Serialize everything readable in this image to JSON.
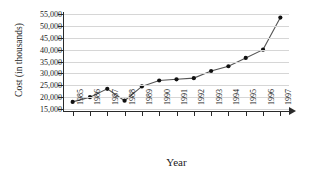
{
  "chart_data": {
    "type": "line",
    "title": "",
    "xlabel": "Year",
    "ylabel": "Cost (in thousands)",
    "x": [
      "1985",
      "1986",
      "1987",
      "1988",
      "1989",
      "1990",
      "1991",
      "1992",
      "1993",
      "1994",
      "1995",
      "1996",
      "1997"
    ],
    "categories": [
      "1985",
      "1986",
      "1987",
      "1988",
      "1989",
      "1990",
      "1991",
      "1992",
      "1993",
      "1994",
      "1995",
      "1996",
      "1997"
    ],
    "values": [
      18000,
      20000,
      23500,
      18500,
      24500,
      27000,
      27500,
      28000,
      31000,
      33000,
      36500,
      40000,
      53500
    ],
    "series": [
      {
        "name": "Cost",
        "values": [
          18000,
          20000,
          23500,
          18500,
          24500,
          27000,
          27500,
          28000,
          31000,
          33000,
          36500,
          40000,
          53500
        ]
      }
    ],
    "ylim": [
      15000,
      55000
    ],
    "yticks": [
      15000,
      20000,
      25000,
      30000,
      35000,
      40000,
      45000,
      50000,
      55000
    ],
    "ytick_labels": [
      "15,000",
      "20,000",
      "25,000",
      "30,000",
      "35,000",
      "40,000",
      "45,000",
      "50,000",
      "55,000"
    ],
    "xtick_labels": [
      "1985",
      "1986",
      "1987",
      "1988",
      "1989",
      "1990",
      "1991",
      "1992",
      "1993",
      "1994",
      "1995",
      "1996",
      "1997"
    ],
    "grid": true,
    "grid_axis": "y",
    "legend": false,
    "legend_position": "none",
    "marker": "circle",
    "line_color": "#555555",
    "marker_color": "#111111",
    "grid_color": "#d6d6d6",
    "axis_color": "#2a2a2a",
    "background": "#ffffff",
    "x_axis_arrow": true
  }
}
